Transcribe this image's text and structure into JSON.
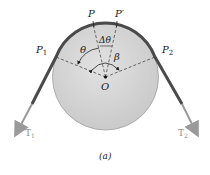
{
  "diagram": {
    "caption": "(a)",
    "labels": {
      "P": "P",
      "P_prime": "P′",
      "P1": "P",
      "P1_sub": "1",
      "P2": "P",
      "P2_sub": "2",
      "theta": "θ",
      "delta_theta": "Δθ",
      "beta": "β",
      "O": "O",
      "T1": "T",
      "T1_sub": "1",
      "T2": "T",
      "T2_sub": "2"
    },
    "colors": {
      "drum_fill": "#d6d6d6",
      "drum_stroke": "#9a9a9a",
      "belt": "#4a4a4a",
      "tension_arrow": "#9a9a9a",
      "dashed": "#333333"
    }
  }
}
